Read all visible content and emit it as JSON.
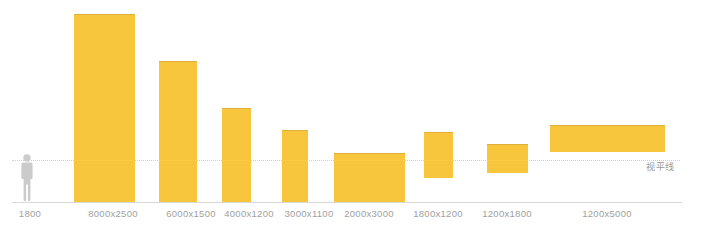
{
  "chart_data": {
    "type": "bar",
    "title": "",
    "subtitle": "",
    "xlabel": "",
    "ylabel": "",
    "grid": false,
    "legend_position": "none",
    "units": "mm",
    "baseline_y_px": 202,
    "horizon_y_px": 160,
    "annotations": [
      {
        "name": "eye-level-line",
        "text": "视平线",
        "y_px": 160,
        "style": "dotted",
        "color": "#cfcfcf"
      }
    ],
    "reference_figure": {
      "name": "human-scale-figure",
      "label": "1800",
      "height_mm": 1800,
      "color": "#cfcfcf"
    },
    "categories": [
      "1800",
      "8000x2500",
      "6000x1500",
      "4000x1200",
      "3000x1100",
      "2000x3000",
      "1800x1200",
      "1200x1800",
      "1200x5000"
    ],
    "bars": [
      {
        "label": "8000x2500",
        "width_mm": 2500,
        "height_mm": 8000,
        "x_px": 74,
        "w_px": 61,
        "top_px": 14,
        "bottom_px": 202,
        "floats": false
      },
      {
        "label": "6000x1500",
        "width_mm": 1500,
        "height_mm": 6000,
        "x_px": 159,
        "w_px": 38,
        "top_px": 61,
        "bottom_px": 202,
        "floats": false
      },
      {
        "label": "4000x1200",
        "width_mm": 1200,
        "height_mm": 4000,
        "x_px": 222,
        "w_px": 29,
        "top_px": 108,
        "bottom_px": 202,
        "floats": false
      },
      {
        "label": "3000x1100",
        "width_mm": 1100,
        "height_mm": 3000,
        "x_px": 282,
        "w_px": 26,
        "top_px": 130,
        "bottom_px": 202,
        "floats": false
      },
      {
        "label": "2000x3000",
        "width_mm": 3000,
        "height_mm": 2000,
        "x_px": 334,
        "w_px": 71,
        "top_px": 153,
        "bottom_px": 202,
        "floats": false
      },
      {
        "label": "1800x1200",
        "width_mm": 1200,
        "height_mm": 1800,
        "x_px": 424,
        "w_px": 29,
        "top_px": 132,
        "bottom_px": 178,
        "floats": true
      },
      {
        "label": "1200x1800",
        "width_mm": 1800,
        "height_mm": 1200,
        "x_px": 487,
        "w_px": 41,
        "top_px": 144,
        "bottom_px": 173,
        "floats": true
      },
      {
        "label": "1200x5000",
        "width_mm": 5000,
        "height_mm": 1200,
        "x_px": 550,
        "w_px": 115,
        "top_px": 125,
        "bottom_px": 152,
        "floats": true
      }
    ],
    "tick_labels": [
      {
        "text": "1800",
        "x_px": 30
      },
      {
        "text": "8000x2500",
        "x_px": 113
      },
      {
        "text": "6000x1500",
        "x_px": 191
      },
      {
        "text": "4000x1200",
        "x_px": 249
      },
      {
        "text": "3000x1100",
        "x_px": 309
      },
      {
        "text": "2000x3000",
        "x_px": 369
      },
      {
        "text": "1800x1200",
        "x_px": 438
      },
      {
        "text": "1200x1800",
        "x_px": 507
      },
      {
        "text": "1200x5000",
        "x_px": 607
      }
    ],
    "colors": {
      "bar": "#f8c63c",
      "bar_edge": "#e0b13a",
      "baseline": "#d8d8d8",
      "horizon": "#cfcfcf",
      "label_text": "#a0a0a0",
      "annotation_text": "#9a9a9a",
      "figure": "#cfcfcf",
      "background": "#ffffff"
    }
  }
}
